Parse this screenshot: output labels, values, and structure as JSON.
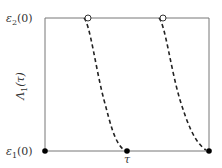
{
  "diagram": {
    "type": "phase-curve-diagram",
    "box": {
      "x0": 45,
      "y0": 18,
      "x1": 209,
      "y1": 151
    },
    "colors": {
      "frame": "#777777",
      "curve": "#222222",
      "dot_fill": "#000000",
      "open_dot_fill": "#ffffff",
      "text": "#333333"
    },
    "labels": {
      "top_left": {
        "symbol": "ε",
        "subscript": "2",
        "suffix": "(0)"
      },
      "bottom_left": {
        "symbol": "ε",
        "subscript": "1",
        "suffix": "(0)"
      },
      "y_axis": {
        "symbol": "Λ",
        "subscript": "1",
        "suffix": "(τ)"
      },
      "x_tick": "τ"
    },
    "open_points": [
      {
        "x": 88,
        "y": 18
      },
      {
        "x": 163,
        "y": 18
      }
    ],
    "filled_points": [
      {
        "x": 45,
        "y": 151
      },
      {
        "x": 127,
        "y": 151
      },
      {
        "x": 209,
        "y": 151
      }
    ],
    "dashed_curves": [
      {
        "from": [
          85,
          19
        ],
        "to": [
          125,
          150
        ]
      },
      {
        "from": [
          160,
          19
        ],
        "to": [
          207,
          150
        ]
      }
    ]
  }
}
